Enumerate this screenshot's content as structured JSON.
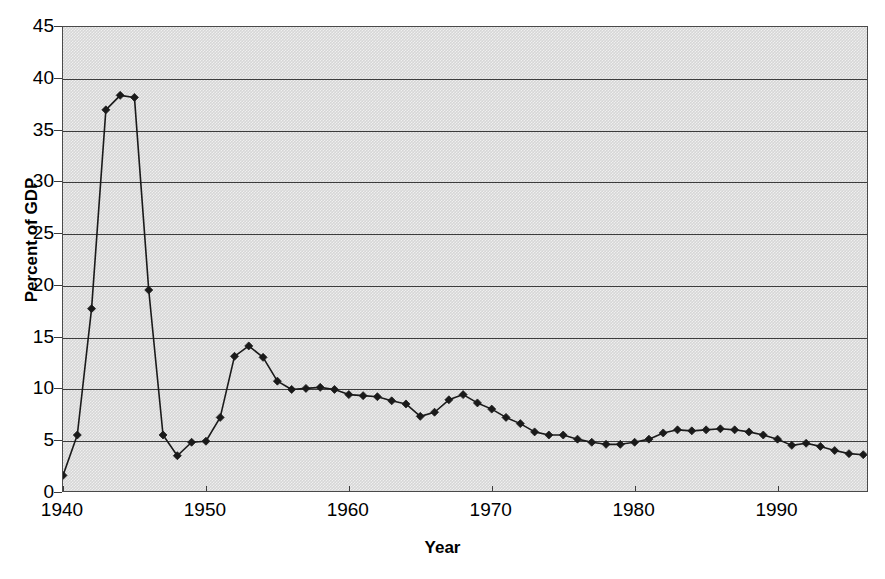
{
  "chart_data": {
    "type": "line",
    "title": "",
    "xlabel": "Year",
    "ylabel": "Percent of GDP",
    "xlim": [
      1940,
      1996.4
    ],
    "ylim": [
      0,
      45
    ],
    "grid": "horizontal",
    "legend": "none",
    "marker": "filled-diamond",
    "line_color": "#1a1a1a",
    "plot_background": "#d6d6d6",
    "frame_color": "#4a4a4a",
    "xticks": [
      1940,
      1950,
      1960,
      1970,
      1980,
      1990
    ],
    "xtick_labels": [
      "1940",
      "1950",
      "1960",
      "1970",
      "1980",
      "1990"
    ],
    "yticks": [
      0,
      5,
      10,
      15,
      20,
      25,
      30,
      35,
      40,
      45
    ],
    "ytick_labels": [
      "0",
      "5",
      "10",
      "15",
      "20",
      "25",
      "30",
      "35",
      "40",
      "45"
    ],
    "x": [
      1940,
      1941,
      1942,
      1943,
      1944,
      1945,
      1946,
      1947,
      1948,
      1949,
      1950,
      1951,
      1952,
      1953,
      1954,
      1955,
      1956,
      1957,
      1958,
      1959,
      1960,
      1961,
      1962,
      1963,
      1964,
      1965,
      1966,
      1967,
      1968,
      1969,
      1970,
      1971,
      1972,
      1973,
      1974,
      1975,
      1976,
      1977,
      1978,
      1979,
      1980,
      1981,
      1982,
      1983,
      1984,
      1985,
      1986,
      1987,
      1988,
      1989,
      1990,
      1991,
      1992,
      1993,
      1994,
      1995,
      1996
    ],
    "values": [
      1.7,
      5.6,
      17.8,
      37.0,
      38.4,
      38.2,
      19.6,
      5.6,
      3.6,
      4.9,
      5.0,
      7.3,
      13.2,
      14.2,
      13.1,
      10.8,
      10.0,
      10.1,
      10.2,
      10.0,
      9.5,
      9.4,
      9.3,
      8.9,
      8.6,
      7.4,
      7.8,
      9.0,
      9.5,
      8.7,
      8.1,
      7.3,
      6.7,
      5.9,
      5.6,
      5.6,
      5.2,
      4.9,
      4.7,
      4.7,
      4.9,
      5.2,
      5.8,
      6.1,
      6.0,
      6.1,
      6.2,
      6.1,
      5.9,
      5.6,
      5.2,
      4.6,
      4.8,
      4.5,
      4.1,
      3.8,
      3.7
    ],
    "series_name": "Defense spending as percent of GDP"
  },
  "axis": {
    "y_title": "Percent of GDP",
    "x_title": "Year"
  }
}
